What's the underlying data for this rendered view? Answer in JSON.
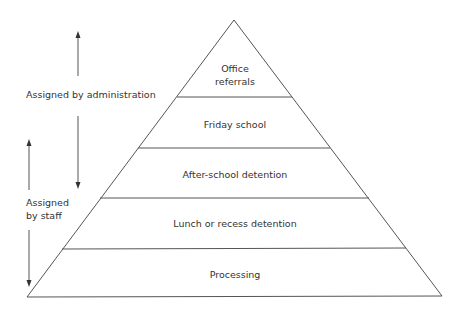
{
  "diagram": {
    "type": "pyramid",
    "levels": [
      {
        "label": "Office\nreferrals",
        "line1": "Office",
        "line2": "referrals"
      },
      {
        "label": "Friday school"
      },
      {
        "label": "After-school detention"
      },
      {
        "label": "Lunch or recess detention"
      },
      {
        "label": "Processing"
      }
    ],
    "side_labels": {
      "administration": "Assigned by administration",
      "staff_line1": "Assigned",
      "staff_line2": "by staff"
    },
    "colors": {
      "line": "#555555",
      "text": "#333333",
      "background": "#ffffff"
    }
  }
}
